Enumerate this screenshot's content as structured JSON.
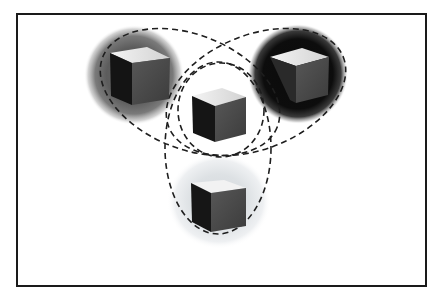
{
  "diagram": {
    "title": "",
    "frame": {
      "border_color": "#1a1a1a",
      "background": "#ffffff"
    },
    "nodes": [
      {
        "id": "cube-top-left",
        "label": "",
        "halo": "mid-gray radial glow",
        "halo_color": "#5a5a5a",
        "cube_top": "#e6e6e6",
        "cube_left": "#141414",
        "cube_right": "#4d4d4d"
      },
      {
        "id": "cube-top-right",
        "label": "",
        "halo": "black radial glow",
        "halo_color": "#0a0a0a",
        "cube_top": "#dcdcdc",
        "cube_left": "#2a2a2a",
        "cube_right": "#5a5a5a"
      },
      {
        "id": "cube-center",
        "label": "",
        "halo": "white radial glow",
        "halo_color": "#ffffff",
        "cube_top": "#e8e8e8",
        "cube_left": "#151515",
        "cube_right": "#4a4a4a"
      },
      {
        "id": "cube-bottom",
        "label": "",
        "halo": "light gray radial glow",
        "halo_color": "#dfe3e6",
        "cube_top": "#f2f2f2",
        "cube_left": "#161616",
        "cube_right": "#474747"
      }
    ],
    "groups": [
      {
        "id": "ellipse-left",
        "style": "dashed",
        "contains": [
          "cube-top-left",
          "cube-center"
        ]
      },
      {
        "id": "ellipse-right",
        "style": "dashed",
        "contains": [
          "cube-top-right",
          "cube-center"
        ]
      },
      {
        "id": "circle-center",
        "style": "dashed",
        "contains": [
          "cube-center"
        ]
      },
      {
        "id": "ellipse-bottom",
        "style": "dashed",
        "contains": [
          "cube-center",
          "cube-bottom"
        ]
      }
    ],
    "stroke_color": "#1e1e1e"
  }
}
